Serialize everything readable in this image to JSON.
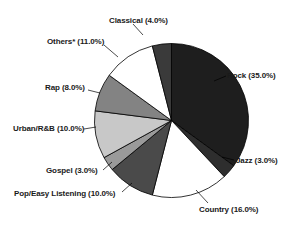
{
  "chart_data": {
    "type": "pie",
    "title": "",
    "subtitle": "",
    "xlabel": "",
    "ylabel": "",
    "legend_position": "none",
    "grid": false,
    "labels_outside": true,
    "start_angle_deg": 0,
    "direction": "clockwise",
    "categories": [
      "Rock",
      "Jazz",
      "Country",
      "Pop/Easy Listening",
      "Gospel",
      "Urban/R&B",
      "Rap",
      "Others*",
      "Classical"
    ],
    "values": [
      35.0,
      3.0,
      16.0,
      10.0,
      3.0,
      10.0,
      8.0,
      11.0,
      4.0
    ],
    "value_unit": "%",
    "slices": [
      {
        "name": "Rock",
        "value": 35.0,
        "label": "Rock (35.0%)",
        "color": "#1e1e1e"
      },
      {
        "name": "Jazz",
        "value": 3.0,
        "label": "Jazz (3.0%)",
        "color": "#2e2e2e"
      },
      {
        "name": "Country",
        "value": 16.0,
        "label": "Country (16.0%)",
        "color": "#ffffff"
      },
      {
        "name": "Pop/Easy Listening",
        "value": 10.0,
        "label": "Pop/Easy Listening (10.0%)",
        "color": "#4a4a4a"
      },
      {
        "name": "Gospel",
        "value": 3.0,
        "label": "Gospel (3.0%)",
        "color": "#9a9a9a"
      },
      {
        "name": "Urban/R&B",
        "value": 10.0,
        "label": "Urban/R&B (10.0%)",
        "color": "#c8c8c8"
      },
      {
        "name": "Rap",
        "value": 8.0,
        "label": "Rap (8.0%)",
        "color": "#838383"
      },
      {
        "name": "Others*",
        "value": 11.0,
        "label": "Others* (11.0%)",
        "color": "#ffffff"
      },
      {
        "name": "Classical",
        "value": 4.0,
        "label": "Classical (4.0%)",
        "color": "#3a3a3a"
      }
    ],
    "outline_color": "#000000",
    "background": "#ffffff"
  }
}
